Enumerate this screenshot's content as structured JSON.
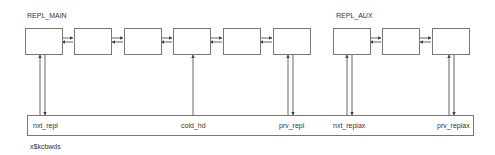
{
  "groups": [
    {
      "title": "REPL_MAIN",
      "box_count": 6
    },
    {
      "title": "REPL_AUX",
      "box_count": 3
    }
  ],
  "structure": {
    "name": "x$kcbwds",
    "fields": [
      {
        "label": "nxt_repl"
      },
      {
        "label": "cold_hd"
      },
      {
        "label": "prv_repl"
      },
      {
        "label": "nxt_replax"
      },
      {
        "label": "prv_replax"
      }
    ]
  },
  "colors": {
    "line": "#555555",
    "box_border": "#777777",
    "text": "#333333"
  }
}
